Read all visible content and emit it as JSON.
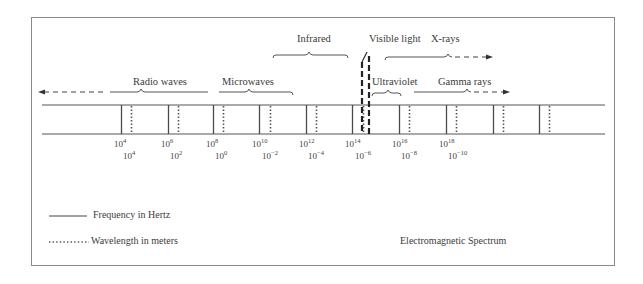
{
  "diagram": {
    "caption": "Electromagnetic Spectrum",
    "legend": {
      "frequency": "Frequency in Hertz",
      "wavelength": "Wavelength in meters"
    },
    "regions": [
      {
        "name": "Radio waves",
        "x": 133,
        "y": 79
      },
      {
        "name": "Microwaves",
        "x": 222,
        "y": 79
      },
      {
        "name": "Infrared",
        "x": 297,
        "y": 36
      },
      {
        "name": "Visible light",
        "x": 369,
        "y": 36
      },
      {
        "name": "X-rays",
        "x": 431,
        "y": 36
      },
      {
        "name": "Ultraviolet",
        "x": 372,
        "y": 79
      },
      {
        "name": "Gamma rays",
        "x": 438,
        "y": 79
      }
    ],
    "frequency_ticks": [
      {
        "base": "10",
        "exp": "4"
      },
      {
        "base": "10",
        "exp": "6"
      },
      {
        "base": "10",
        "exp": "8"
      },
      {
        "base": "10",
        "exp": "10"
      },
      {
        "base": "10",
        "exp": "12"
      },
      {
        "base": "10",
        "exp": "14"
      },
      {
        "base": "10",
        "exp": "16"
      },
      {
        "base": "10",
        "exp": "18"
      }
    ],
    "wavelength_ticks": [
      {
        "base": "10",
        "exp": "4"
      },
      {
        "base": "10",
        "exp": "2"
      },
      {
        "base": "10",
        "exp": "0"
      },
      {
        "base": "10",
        "exp": "−2"
      },
      {
        "base": "10",
        "exp": "−4"
      },
      {
        "base": "10",
        "exp": "−6"
      },
      {
        "base": "10",
        "exp": "−8"
      },
      {
        "base": "10",
        "exp": "−10"
      }
    ],
    "solid_line_x": [
      121,
      168,
      213,
      259,
      306,
      352,
      399,
      446,
      493,
      539
    ],
    "dotted_line_x": [
      131,
      178,
      223,
      270,
      316,
      363,
      409,
      456,
      503,
      549
    ],
    "colors": {
      "line": "#4a4a4a",
      "frame": "#8a8a8a",
      "text": "#3b3b3b"
    }
  }
}
